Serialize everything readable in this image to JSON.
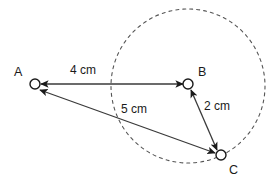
{
  "figure": {
    "type": "geometry-vector-diagram",
    "background_color": "#ffffff",
    "stroke_color": "#1a1a1a",
    "dashed_stroke_color": "#555555",
    "arrow_line_color": "#3a3a3a",
    "points": [
      {
        "id": "A",
        "label": "A",
        "cx": 35,
        "cy": 84,
        "r": 5,
        "label_x": 14,
        "label_y": 66
      },
      {
        "id": "B",
        "label": "B",
        "cx": 188,
        "cy": 84,
        "r": 5,
        "label_x": 198,
        "label_y": 66
      },
      {
        "id": "C",
        "label": "C",
        "cx": 221,
        "cy": 155,
        "r": 5,
        "label_x": 229,
        "label_y": 164
      }
    ],
    "dashed_circle": {
      "name": "dashed-construction-circle",
      "cx": 188,
      "cy": 86,
      "r": 77,
      "dash": "3 4"
    },
    "vectors": [
      {
        "id": "AB",
        "from": "B",
        "to": "A",
        "label": "4 cm",
        "label_x": 70,
        "label_y": 64,
        "double_headed": true
      },
      {
        "id": "BC",
        "from": "C",
        "to": "B",
        "label": "2 cm",
        "label_x": 204,
        "label_y": 100,
        "double_headed": true
      },
      {
        "id": "AC",
        "from": "C",
        "to": "A",
        "label": "5 cm",
        "label_x": 121,
        "label_y": 103,
        "double_headed": true
      }
    ]
  }
}
